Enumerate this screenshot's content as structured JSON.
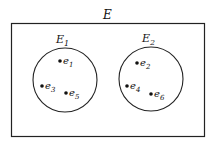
{
  "universe": {
    "label": "E"
  },
  "sets": [
    {
      "label": "E",
      "sub": "1",
      "elements": [
        {
          "name": "e",
          "sub": "1"
        },
        {
          "name": "e",
          "sub": "3"
        },
        {
          "name": "e",
          "sub": "5"
        }
      ]
    },
    {
      "label": "E",
      "sub": "2",
      "elements": [
        {
          "name": "e",
          "sub": "2"
        },
        {
          "name": "e",
          "sub": "4"
        },
        {
          "name": "e",
          "sub": "6"
        }
      ]
    }
  ],
  "colors": {
    "stroke": "#222222",
    "background": "#ffffff"
  }
}
